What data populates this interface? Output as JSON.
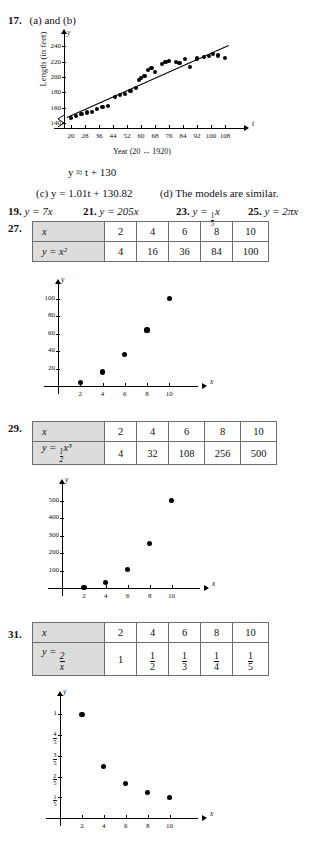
{
  "problem17": {
    "number": "17.",
    "prompt": "(a) and (b)",
    "chart_caption": "Year (20 ↔ 1920)",
    "ylabel": "Length (in feet)",
    "equation_b": "y ≈ t + 130",
    "part_c": "(c)  y = 1.01t + 130.82",
    "part_d": "(d) The models are similar.",
    "axis_x_name": "t",
    "axis_y_name": "y"
  },
  "answers_row": {
    "a19_num": "19.",
    "a19_text": "y = 7x",
    "a21_num": "21.",
    "a21_text": "y = 205x",
    "a23_num": "23.",
    "a23_prefix": "y = ",
    "a23_frac_num": "1",
    "a23_frac_den": "5",
    "a23_suffix": "x",
    "a25_num": "25.",
    "a25_text": "y = 2πx"
  },
  "problem27": {
    "number": "27.",
    "header_x": "x",
    "header_y": "y = x²",
    "x_values": [
      "2",
      "4",
      "6",
      "8",
      "10"
    ],
    "y_values": [
      "4",
      "16",
      "36",
      "84",
      "100"
    ],
    "axis_x_name": "x",
    "axis_y_name": "y",
    "x_ticks": [
      "2",
      "4",
      "6",
      "8",
      "10"
    ],
    "y_ticks": [
      "20",
      "40",
      "60",
      "80",
      "100"
    ]
  },
  "problem29": {
    "number": "29.",
    "header_x": "x",
    "header_y_prefix": "y = ",
    "header_y_frac_num": "1",
    "header_y_frac_den": "2",
    "header_y_suffix": "x³",
    "x_values": [
      "2",
      "4",
      "6",
      "8",
      "10"
    ],
    "y_values": [
      "4",
      "32",
      "108",
      "256",
      "500"
    ],
    "axis_x_name": "x",
    "axis_y_name": "y",
    "x_ticks": [
      "2",
      "4",
      "6",
      "8",
      "10"
    ],
    "y_ticks": [
      "100",
      "200",
      "300",
      "400",
      "500"
    ]
  },
  "problem31": {
    "number": "31.",
    "header_x": "x",
    "header_y_prefix": "y = ",
    "header_y_frac_num": "2",
    "header_y_frac_den": "x",
    "x_values": [
      "2",
      "4",
      "6",
      "8",
      "10"
    ],
    "y_values": [
      {
        "whole": "1"
      },
      {
        "num": "1",
        "den": "2"
      },
      {
        "num": "1",
        "den": "3"
      },
      {
        "num": "1",
        "den": "4"
      },
      {
        "num": "1",
        "den": "5"
      }
    ],
    "axis_x_name": "x",
    "axis_y_name": "y",
    "x_ticks": [
      "2",
      "4",
      "6",
      "8",
      "10"
    ],
    "y_ticks": [
      {
        "whole": "1"
      },
      {
        "num": "4",
        "den": "5"
      },
      {
        "num": "3",
        "den": "5"
      },
      {
        "num": "2",
        "den": "5"
      },
      {
        "num": "1",
        "den": "5"
      }
    ]
  },
  "chart_data": [
    {
      "type": "scatter",
      "id": "bridge-length-scatter",
      "title": "",
      "xlabel": "Year (20 ↔ 1920)",
      "ylabel": "Length (in feet)",
      "xlim": [
        16,
        112
      ],
      "ylim": [
        134,
        248
      ],
      "x_ticks": [
        20,
        28,
        36,
        44,
        52,
        60,
        68,
        76,
        84,
        92,
        100,
        108
      ],
      "y_ticks": [
        140,
        160,
        180,
        200,
        220,
        240
      ],
      "axis_break_y": true,
      "grid": false,
      "points": [
        [
          20,
          147
        ],
        [
          23,
          150
        ],
        [
          26,
          152
        ],
        [
          29,
          154
        ],
        [
          32,
          155
        ],
        [
          35,
          159
        ],
        [
          38,
          161
        ],
        [
          41,
          163
        ],
        [
          45,
          174
        ],
        [
          48,
          177
        ],
        [
          51,
          178
        ],
        [
          54,
          182
        ],
        [
          57,
          186
        ],
        [
          59,
          196
        ],
        [
          60,
          199
        ],
        [
          62,
          201
        ],
        [
          64,
          209
        ],
        [
          66,
          212
        ],
        [
          68,
          207
        ],
        [
          72,
          217
        ],
        [
          74,
          219
        ],
        [
          76,
          221
        ],
        [
          80,
          219
        ],
        [
          82,
          218
        ],
        [
          85,
          223
        ],
        [
          88,
          213
        ],
        [
          92,
          224
        ],
        [
          96,
          226
        ],
        [
          99,
          227
        ],
        [
          101,
          230
        ],
        [
          104,
          228
        ],
        [
          108,
          225
        ]
      ],
      "fit_line": {
        "label": "y ≈ t + 130",
        "slope": 1.01,
        "intercept": 130.82
      }
    },
    {
      "type": "scatter",
      "id": "x-squared-scatter",
      "title": "",
      "xlabel": "x",
      "ylabel": "y",
      "xlim": [
        0,
        11.5
      ],
      "ylim": [
        0,
        112
      ],
      "x_ticks": [
        2,
        4,
        6,
        8,
        10
      ],
      "y_ticks": [
        20,
        40,
        60,
        80,
        100
      ],
      "grid": false,
      "x": [
        2,
        4,
        6,
        8,
        10
      ],
      "values": [
        4,
        16,
        36,
        64,
        100
      ]
    },
    {
      "type": "scatter",
      "id": "half-x-cubed-scatter",
      "title": "",
      "xlabel": "x",
      "ylabel": "y",
      "xlim": [
        0,
        11.5
      ],
      "ylim": [
        0,
        560
      ],
      "x_ticks": [
        2,
        4,
        6,
        8,
        10
      ],
      "y_ticks": [
        100,
        200,
        300,
        400,
        500
      ],
      "grid": false,
      "x": [
        2,
        4,
        6,
        8,
        10
      ],
      "values": [
        4,
        32,
        108,
        256,
        500
      ]
    },
    {
      "type": "scatter",
      "id": "two-over-x-scatter",
      "title": "",
      "xlabel": "x",
      "ylabel": "y",
      "xlim": [
        0,
        11.5
      ],
      "ylim": [
        0,
        1.12
      ],
      "x_ticks": [
        2,
        4,
        6,
        8,
        10
      ],
      "y_ticks": [
        0.2,
        0.4,
        0.6,
        0.8,
        1.0
      ],
      "y_tick_labels": [
        "1/5",
        "2/5",
        "3/5",
        "4/5",
        "1"
      ],
      "grid": false,
      "x": [
        2,
        4,
        6,
        8,
        10
      ],
      "values": [
        1,
        0.5,
        0.3333,
        0.25,
        0.2
      ]
    }
  ]
}
